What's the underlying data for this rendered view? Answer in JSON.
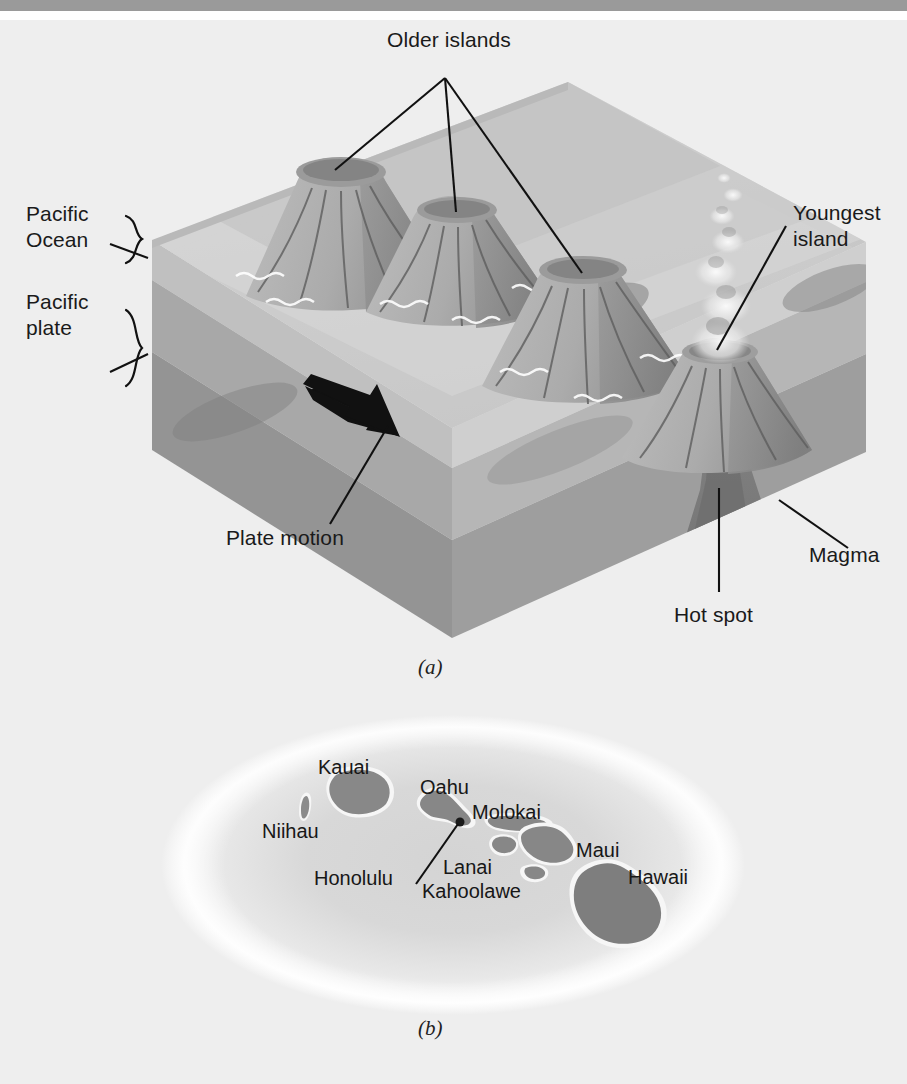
{
  "figure": {
    "background_color": "#eeeeee",
    "rule_color": "#9a9a9a"
  },
  "panel_a": {
    "caption": "(a)",
    "labels": {
      "older_islands": "Older islands",
      "pacific_ocean": "Pacific\nOcean",
      "pacific_ocean_line1": "Pacific",
      "pacific_ocean_line2": "Ocean",
      "pacific_plate_line1": "Pacific",
      "pacific_plate_line2": "plate",
      "youngest_island_line1": "Youngest",
      "youngest_island_line2": "island",
      "plate_motion": "Plate motion",
      "hot_spot": "Hot spot",
      "magma": "Magma"
    },
    "colors": {
      "water_top": "#c9c9c9",
      "water_side": "#b4b4b4",
      "crust": "#a0a0a0",
      "mantle": "#8e8e8e",
      "magma": "#7a7a7a",
      "volcano_light": "#b0b0b0",
      "volcano_dark": "#8a8a8a",
      "line": "#111111",
      "wave": "#ffffff"
    },
    "volcano_count": 4,
    "arrow_direction": "up-left"
  },
  "panel_b": {
    "caption": "(b)",
    "islands": [
      {
        "name": "Kauai",
        "label_x": 318,
        "label_y": 86
      },
      {
        "name": "Niihau",
        "label_x": 262,
        "label_y": 150
      },
      {
        "name": "Oahu",
        "label_x": 420,
        "label_y": 108
      },
      {
        "name": "Molokai",
        "label_x": 472,
        "label_y": 132
      },
      {
        "name": "Maui",
        "label_x": 572,
        "label_y": 168
      },
      {
        "name": "Lanai",
        "label_x": 444,
        "label_y": 184
      },
      {
        "name": "Kahoolawe",
        "label_x": 422,
        "label_y": 208
      },
      {
        "name": "Honolulu",
        "label_x": 314,
        "label_y": 196
      },
      {
        "name": "Hawaii",
        "label_x": 630,
        "label_y": 196
      }
    ],
    "colors": {
      "ocean_fill": "#dcdcdc",
      "ocean_glow": "#ffffff",
      "island_fill": "#8b8b8b",
      "island_halo": "#f5f5f5",
      "label": "#171717"
    },
    "city_marker": "Honolulu"
  }
}
